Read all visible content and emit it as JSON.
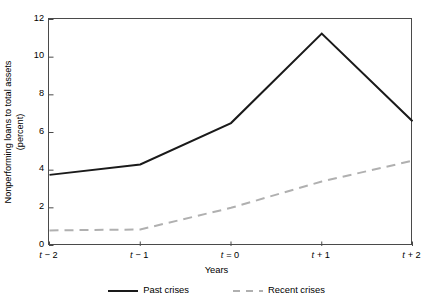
{
  "chart_data": {
    "type": "line",
    "title": "",
    "xlabel": "Years",
    "ylabel": "Nonperforming loans to total assets (percent)",
    "ylabel_line1": "Nonperforming loans to total assets",
    "ylabel_line2": "(percent)",
    "categories": [
      "t − 2",
      "t − 1",
      "t = 0",
      "t + 1",
      "t + 2"
    ],
    "category_prefix": "t",
    "category_suffixes": [
      " − 2",
      " − 1",
      " = 0",
      " + 1",
      " + 2"
    ],
    "ylim": [
      0,
      12
    ],
    "yticks": [
      0,
      2,
      4,
      6,
      8,
      10,
      12
    ],
    "ytick_labels": [
      "0",
      "2",
      "4",
      "6",
      "8",
      "10",
      "12"
    ],
    "grid": false,
    "legend_position": "bottom",
    "series": [
      {
        "name": "Past crises",
        "style": "solid",
        "color": "#1a1a1a",
        "width": 2.0,
        "values": [
          3.75,
          4.3,
          6.5,
          11.25,
          6.6
        ]
      },
      {
        "name": "Recent crises",
        "style": "dashed",
        "color": "#b0b0b0",
        "width": 2.0,
        "values": [
          0.8,
          0.85,
          2.0,
          3.4,
          4.5
        ]
      }
    ]
  },
  "colors": {
    "axis": "#4a4a4a",
    "past_crises": "#1a1a1a",
    "recent_crises": "#b0b0b0",
    "background": "#ffffff"
  }
}
